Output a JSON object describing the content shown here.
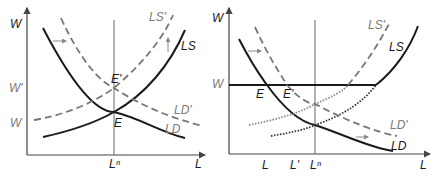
{
  "left_panel": {
    "y_axis_label": "W",
    "x_axis_label": "L",
    "y_ticks": [
      "W'",
      "W"
    ],
    "x_ticks": [
      "Lⁿ"
    ],
    "curves": {
      "ls": "LS",
      "ls_prime": "LS'",
      "ld": "LD",
      "ld_prime": "LD'"
    },
    "points": {
      "e": "E",
      "e_prime": "E'"
    }
  },
  "right_panel": {
    "y_axis_label": "W",
    "x_axis_label": "L",
    "y_ticks": [
      "W"
    ],
    "x_ticks": [
      "L",
      "L'",
      "Lⁿ"
    ],
    "curves": {
      "ls": "LS",
      "ls_prime": "LS'",
      "ld": "LD",
      "ld_prime": "LD'"
    },
    "points": {
      "e": "E",
      "e_prime": "E'"
    }
  },
  "colors": {
    "solid_curve": "#1a1a1a",
    "shifted_curve": "#777777",
    "axis": "#444444"
  }
}
